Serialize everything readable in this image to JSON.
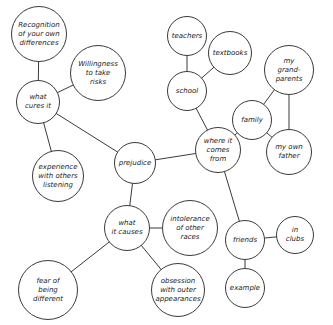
{
  "diagram": {
    "type": "concept-map",
    "center": "prejudice",
    "nodes": [
      {
        "id": "recognition",
        "label": "Recognition\nof your own\ndifferences",
        "x": 39,
        "y": 34,
        "r": 28
      },
      {
        "id": "willingness",
        "label": "Willingness\nto take\nrisks",
        "x": 98,
        "y": 73,
        "r": 28
      },
      {
        "id": "what-cures-it",
        "label": "what\ncures it",
        "x": 38,
        "y": 102,
        "r": 22
      },
      {
        "id": "experience",
        "label": "experience\nwith others\nlistening",
        "x": 58,
        "y": 176,
        "r": 26
      },
      {
        "id": "prejudice",
        "label": "prejudice",
        "x": 135,
        "y": 163,
        "r": 21
      },
      {
        "id": "what-it-causes",
        "label": "what\nit causes",
        "x": 127,
        "y": 228,
        "r": 23
      },
      {
        "id": "intolerance",
        "label": "intolerance\nof other\nraces",
        "x": 190,
        "y": 228,
        "r": 28
      },
      {
        "id": "fear",
        "label": "fear of\nbeing\ndifferent",
        "x": 48,
        "y": 290,
        "r": 30
      },
      {
        "id": "obsession",
        "label": "obsession\nwith outer\nappearances",
        "x": 178,
        "y": 290,
        "r": 27
      },
      {
        "id": "teachers",
        "label": "teachers",
        "x": 187,
        "y": 36,
        "r": 20
      },
      {
        "id": "textbooks",
        "label": "textbooks",
        "x": 230,
        "y": 53,
        "r": 22
      },
      {
        "id": "school",
        "label": "school",
        "x": 187,
        "y": 91,
        "r": 20
      },
      {
        "id": "where-it-comes-from",
        "label": "where it\ncomes\nfrom",
        "x": 218,
        "y": 150,
        "r": 23
      },
      {
        "id": "family",
        "label": "family",
        "x": 252,
        "y": 120,
        "r": 20
      },
      {
        "id": "my-grandparents",
        "label": "my\ngrand-\nparents",
        "x": 289,
        "y": 70,
        "r": 25
      },
      {
        "id": "my-own-father",
        "label": "my own\nfather",
        "x": 289,
        "y": 152,
        "r": 23
      },
      {
        "id": "friends",
        "label": "friends",
        "x": 245,
        "y": 240,
        "r": 20
      },
      {
        "id": "in-clubs",
        "label": "in\nclubs",
        "x": 295,
        "y": 235,
        "r": 19
      },
      {
        "id": "example",
        "label": "example",
        "x": 245,
        "y": 288,
        "r": 20
      }
    ],
    "edges": [
      [
        "recognition",
        "what-cures-it"
      ],
      [
        "willingness",
        "what-cures-it"
      ],
      [
        "what-cures-it",
        "experience"
      ],
      [
        "what-cures-it",
        "prejudice"
      ],
      [
        "prejudice",
        "where-it-comes-from"
      ],
      [
        "prejudice",
        "what-it-causes"
      ],
      [
        "what-it-causes",
        "intolerance"
      ],
      [
        "what-it-causes",
        "fear"
      ],
      [
        "what-it-causes",
        "obsession"
      ],
      [
        "teachers",
        "school"
      ],
      [
        "textbooks",
        "school"
      ],
      [
        "school",
        "where-it-comes-from"
      ],
      [
        "where-it-comes-from",
        "family"
      ],
      [
        "family",
        "my-grandparents"
      ],
      [
        "family",
        "my-own-father"
      ],
      [
        "my-grandparents",
        "my-own-father"
      ],
      [
        "where-it-comes-from",
        "friends"
      ],
      [
        "friends",
        "in-clubs"
      ],
      [
        "friends",
        "example"
      ]
    ],
    "colors": {
      "stroke": "#3a3a3a",
      "text": "#222222",
      "background": "#ffffff"
    }
  }
}
